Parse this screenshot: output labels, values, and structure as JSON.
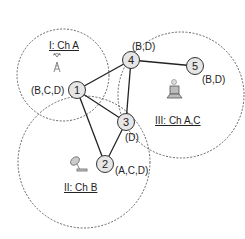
{
  "regions": [
    {
      "id": "I",
      "label": "I: Ch A",
      "cx": 63,
      "cy": 75,
      "r": 46,
      "icon": "cell-tower-icon"
    },
    {
      "id": "II",
      "label": "II: Ch B",
      "cx": 84,
      "cy": 162,
      "r": 66,
      "icon": "satellite-dish-icon"
    },
    {
      "id": "III",
      "label": "III: Ch A,C",
      "cx": 181,
      "cy": 95,
      "r": 63,
      "icon": "laptop-icon"
    }
  ],
  "nodes": [
    {
      "id": "1",
      "x": 77,
      "y": 90,
      "channels": "(B,C,D)"
    },
    {
      "id": "2",
      "x": 105,
      "y": 164,
      "channels": "(A,C,D)"
    },
    {
      "id": "3",
      "x": 126,
      "y": 122,
      "channels": "(D)"
    },
    {
      "id": "4",
      "x": 131,
      "y": 60,
      "channels": "(B,D)"
    },
    {
      "id": "5",
      "x": 195,
      "y": 66,
      "channels": "(B,D)"
    }
  ],
  "edges": [
    [
      "1",
      "4"
    ],
    [
      "1",
      "3"
    ],
    [
      "1",
      "2"
    ],
    [
      "2",
      "3"
    ],
    [
      "3",
      "4"
    ],
    [
      "4",
      "5"
    ]
  ],
  "colors": {
    "line": "#222222",
    "node_fill": "#e6e6e6",
    "circle": "#555555"
  }
}
